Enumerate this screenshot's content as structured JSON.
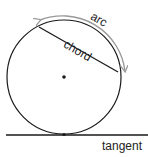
{
  "diagram": {
    "labels": {
      "arc": "arc",
      "chord": "chord",
      "tangent": "tangent"
    },
    "colors": {
      "stroke": "#1a1a1a",
      "arc_arrow": "#9a9a9a",
      "text": "#222222",
      "background": "#ffffff"
    },
    "geometry": {
      "circle": {
        "cx": 64,
        "cy": 77,
        "r": 57
      },
      "chord": {
        "x1": 39,
        "y1": 27,
        "x2": 118,
        "y2": 72
      },
      "tangent": {
        "x1": 6,
        "y1": 135,
        "x2": 148,
        "y2": 135
      },
      "center_point": {
        "cx": 64,
        "cy": 77
      },
      "tangent_point": {
        "cx": 64,
        "cy": 134
      }
    }
  }
}
